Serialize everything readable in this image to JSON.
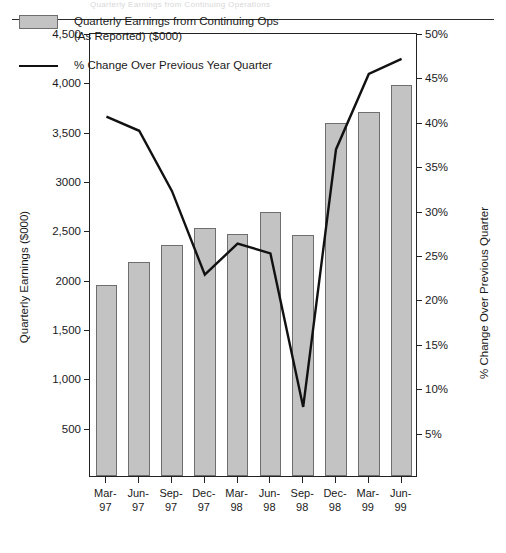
{
  "page": {
    "cropped_header_text": "Quarterly Earnings from Continuing Operations"
  },
  "chart_data": {
    "type": "bar",
    "title": "",
    "subtitle": "",
    "categories": [
      "Mar-97",
      "Jun-97",
      "Sep-97",
      "Dec-97",
      "Mar-98",
      "Jun-98",
      "Sep-98",
      "Dec-98",
      "Mar-99",
      "Jun-99"
    ],
    "category_lines": [
      [
        "Mar-",
        "97"
      ],
      [
        "Jun-",
        "97"
      ],
      [
        "Sep-",
        "97"
      ],
      [
        "Dec-",
        "97"
      ],
      [
        "Mar-",
        "98"
      ],
      [
        "Jun-",
        "98"
      ],
      [
        "Sep-",
        "98"
      ],
      [
        "Dec-",
        "98"
      ],
      [
        "Mar-",
        "99"
      ],
      [
        "Jun-",
        "99"
      ]
    ],
    "xlabel": "",
    "ylabel": "Quarterly Earnings ($000)",
    "y2label": "% Change Over Previous Quarter",
    "ylim": [
      0,
      4500
    ],
    "y2lim": [
      0,
      50
    ],
    "yticks": [
      0,
      500,
      1000,
      1500,
      2000,
      2500,
      3000,
      3500,
      4000,
      4500
    ],
    "ytick_labels": [
      "0",
      "500",
      "1,000",
      "1,500",
      "2000",
      "2,500",
      "3000",
      "3,500",
      "4,000",
      "4,500"
    ],
    "ytick_labels_shown": [
      "500",
      "1,000",
      "1,500",
      "2000",
      "2,500",
      "3000",
      "3,500",
      "4,000",
      "4,500"
    ],
    "y2ticks": [
      5,
      10,
      15,
      20,
      25,
      30,
      35,
      40,
      45,
      50
    ],
    "y2tick_labels": [
      "5%",
      "10%",
      "15%",
      "20%",
      "25%",
      "30%",
      "35%",
      "40%",
      "45%",
      "50%"
    ],
    "grid": false,
    "legend_position": "upper-left-inside",
    "series": [
      {
        "name": "Quarterly Earnings from Continuing Ops (As Reported) ($000)",
        "type": "bar",
        "axis": "left",
        "color": "#c3c3c3",
        "edge_color": "#6e6e6e",
        "values": [
          1940,
          2165,
          2340,
          2510,
          2450,
          2680,
          2440,
          3580,
          3685,
          3960
        ]
      },
      {
        "name": "% Change Over Previous Year Quarter",
        "type": "line",
        "axis": "right",
        "color": "#111111",
        "values": [
          40.7,
          39.1,
          32.3,
          22.9,
          26.4,
          25.3,
          8.0,
          37.0,
          45.5,
          47.2
        ]
      }
    ]
  },
  "legend": {
    "items": [
      {
        "marker": "bar-swatch",
        "label_line1": "Quarterly Earnings from Continuing Ops",
        "label_line2": "(As Reported) ($000)"
      },
      {
        "marker": "line-swatch",
        "label_line1": "% Change Over Previous Year Quarter",
        "label_line2": ""
      }
    ]
  }
}
